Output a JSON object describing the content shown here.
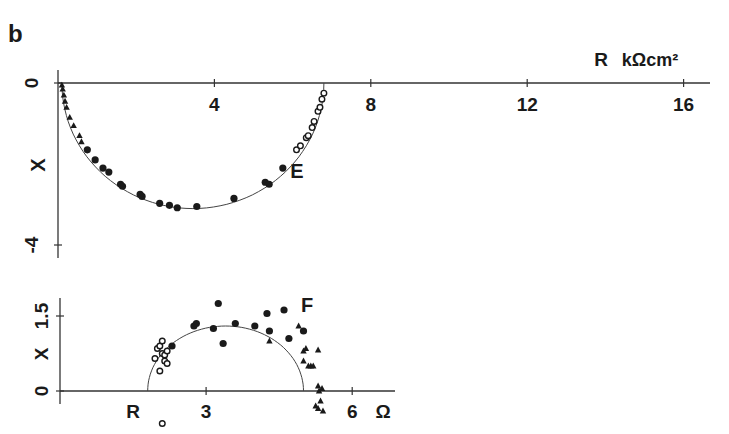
{
  "panel_label": "b",
  "chart_data": [
    {
      "type": "scatter",
      "name": "E",
      "title": "E",
      "xlabel": "R",
      "x_unit": "kΩcm²",
      "ylabel": "X",
      "xlim": [
        0,
        16.6
      ],
      "ylim": [
        -4.2,
        0
      ],
      "x_ticks": [
        4,
        8,
        12,
        16
      ],
      "y_ticks": [
        0,
        -4
      ],
      "x_tick_labels": [
        "4",
        "8",
        "12",
        "16"
      ],
      "y_tick_labels": [
        "0",
        "-4"
      ],
      "grid": false,
      "fit_curve": {
        "type": "semicircle",
        "r_start": 0.1,
        "r_end": 6.8,
        "min_x": -3.1
      },
      "series": [
        {
          "name": "filled triangles (high frequency)",
          "marker": "triangle-filled",
          "points": [
            [
              0.1,
              -0.05
            ],
            [
              0.12,
              -0.15
            ],
            [
              0.15,
              -0.3
            ],
            [
              0.18,
              -0.45
            ],
            [
              0.22,
              -0.6
            ],
            [
              0.3,
              -0.85
            ],
            [
              0.4,
              -1.05
            ],
            [
              0.55,
              -1.3
            ],
            [
              0.6,
              -1.45
            ]
          ]
        },
        {
          "name": "filled circles",
          "marker": "circle-filled",
          "points": [
            [
              0.75,
              -1.65
            ],
            [
              0.95,
              -1.9
            ],
            [
              1.15,
              -2.1
            ],
            [
              1.3,
              -2.2
            ],
            [
              1.6,
              -2.5
            ],
            [
              1.65,
              -2.55
            ],
            [
              2.1,
              -2.75
            ],
            [
              2.15,
              -2.8
            ],
            [
              2.6,
              -2.97
            ],
            [
              2.85,
              -3.02
            ],
            [
              3.05,
              -3.08
            ],
            [
              3.55,
              -3.05
            ],
            [
              4.5,
              -2.85
            ],
            [
              5.3,
              -2.45
            ],
            [
              5.4,
              -2.5
            ],
            [
              5.75,
              -2.1
            ]
          ]
        },
        {
          "name": "open circles (low frequency)",
          "marker": "circle-open",
          "points": [
            [
              6.1,
              -1.65
            ],
            [
              6.2,
              -1.55
            ],
            [
              6.35,
              -1.35
            ],
            [
              6.4,
              -1.3
            ],
            [
              6.5,
              -1.1
            ],
            [
              6.55,
              -0.95
            ],
            [
              6.65,
              -0.7
            ],
            [
              6.7,
              -0.6
            ],
            [
              6.75,
              -0.4
            ],
            [
              6.8,
              -0.25
            ]
          ]
        }
      ]
    },
    {
      "type": "scatter",
      "name": "F",
      "title": "F",
      "xlabel": "R",
      "x_unit": "Ω",
      "ylabel": "X",
      "xlim": [
        0,
        7.3
      ],
      "ylim": [
        0,
        1.8
      ],
      "x_ticks": [
        3,
        6
      ],
      "y_ticks": [
        0,
        1.5
      ],
      "x_tick_labels": [
        "3",
        "6"
      ],
      "y_tick_labels": [
        "0",
        "1.5"
      ],
      "grid": false,
      "fit_curve": {
        "type": "semicircle",
        "r_start": 1.8,
        "r_end": 5.0,
        "max_x": 1.3
      },
      "series": [
        {
          "name": "open circles",
          "marker": "circle-open",
          "points": [
            [
              1.95,
              0.65
            ],
            [
              2.0,
              0.85
            ],
            [
              2.05,
              0.9
            ],
            [
              2.1,
              0.75
            ],
            [
              2.15,
              0.6
            ],
            [
              2.15,
              0.72
            ],
            [
              2.2,
              0.55
            ],
            [
              2.1,
              1.0
            ],
            [
              2.2,
              0.8
            ],
            [
              2.05,
              0.4
            ],
            [
              2.1,
              -0.65
            ]
          ]
        },
        {
          "name": "filled circles",
          "marker": "circle-filled",
          "points": [
            [
              2.3,
              0.9
            ],
            [
              2.75,
              1.3
            ],
            [
              2.8,
              1.35
            ],
            [
              3.15,
              1.25
            ],
            [
              3.25,
              1.75
            ],
            [
              3.35,
              0.95
            ],
            [
              3.6,
              1.35
            ],
            [
              4.0,
              1.3
            ],
            [
              4.25,
              1.55
            ],
            [
              4.3,
              1.2
            ],
            [
              4.6,
              1.62
            ],
            [
              4.7,
              1.05
            ],
            [
              5.0,
              1.2
            ]
          ]
        },
        {
          "name": "filled triangles",
          "marker": "triangle-filled",
          "points": [
            [
              4.3,
              1.0
            ],
            [
              4.9,
              1.3
            ],
            [
              5.0,
              0.8
            ],
            [
              5.05,
              0.85
            ],
            [
              5.0,
              0.6
            ],
            [
              5.1,
              0.5
            ],
            [
              5.15,
              0.5
            ],
            [
              5.2,
              0.5
            ],
            [
              5.3,
              0.82
            ],
            [
              5.3,
              0.1
            ],
            [
              5.32,
              0.0
            ],
            [
              5.35,
              -0.2
            ],
            [
              5.38,
              0.05
            ],
            [
              5.3,
              -0.35
            ],
            [
              5.4,
              -0.4
            ],
            [
              5.25,
              -0.3
            ]
          ]
        }
      ]
    }
  ]
}
